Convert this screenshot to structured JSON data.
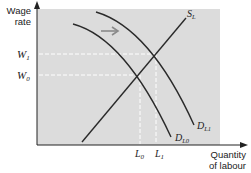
{
  "diagram": {
    "title": "",
    "y_axis_label_line1": "Wage",
    "y_axis_label_line2": "rate",
    "x_axis_label_line1": "Quantity",
    "x_axis_label_line2": "of labour",
    "wage_levels": [
      {
        "main": "W",
        "sub": "1"
      },
      {
        "main": "W",
        "sub": "0"
      }
    ],
    "labour_levels": [
      {
        "main": "L",
        "sub": "0"
      },
      {
        "main": "L",
        "sub": "1"
      }
    ],
    "curves": {
      "supply": {
        "main": "S",
        "sub": "L"
      },
      "demand_original": {
        "main": "D",
        "sub": "L0"
      },
      "demand_new": {
        "main": "D",
        "sub": "L1"
      }
    },
    "shift_direction": "right",
    "colors": {
      "plot_background": "#dcdcdc",
      "curve": "#2a2a2a",
      "guide": "#ffffff",
      "arrow": "#8a8a8a"
    }
  }
}
